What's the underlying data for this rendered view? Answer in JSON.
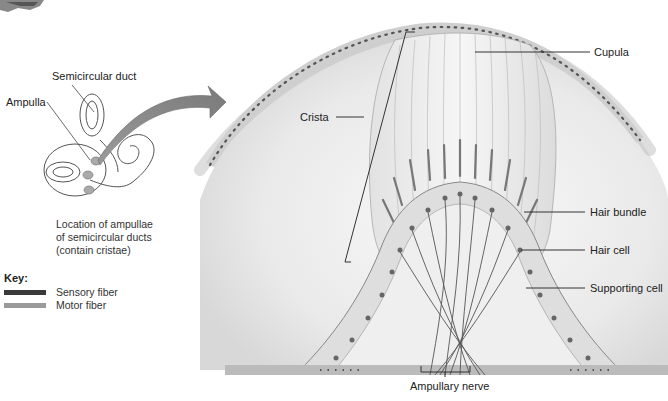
{
  "inset": {
    "labels": {
      "semicircular_duct": "Semicircular duct",
      "ampulla": "Ampulla"
    },
    "caption_lines": [
      "Location of ampullae",
      "of semicircular ducts",
      "(contain cristae)"
    ]
  },
  "key": {
    "title": "Key:",
    "items": [
      {
        "label": "Sensory fiber",
        "color": "#3a3a3a"
      },
      {
        "label": "Motor fiber",
        "color": "#9a9a9a"
      }
    ]
  },
  "main": {
    "labels": {
      "cupula": "Cupula",
      "crista": "Crista",
      "hair_bundle": "Hair bundle",
      "hair_cell": "Hair cell",
      "supporting_cell": "Supporting cell",
      "ampullary_nerve": "Ampullary nerve"
    }
  }
}
